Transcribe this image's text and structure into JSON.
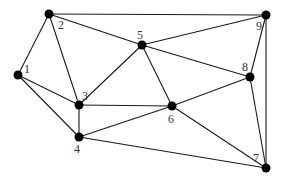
{
  "diagram": {
    "type": "undirected-graph",
    "colors": {
      "edge": "#1a1a1a",
      "node": "#000000",
      "label": "#333333",
      "background": "#ffffff"
    },
    "nodes": [
      {
        "id": "1",
        "label": "1",
        "x": 18,
        "y": 75,
        "label_dx": 6,
        "label_dy": -2
      },
      {
        "id": "2",
        "label": "2",
        "x": 49,
        "y": 14,
        "label_dx": 9,
        "label_dy": 15
      },
      {
        "id": "3",
        "label": "3",
        "x": 79,
        "y": 105,
        "label_dx": 3,
        "label_dy": -5
      },
      {
        "id": "4",
        "label": "4",
        "x": 79,
        "y": 137,
        "label_dx": -5,
        "label_dy": 16
      },
      {
        "id": "5",
        "label": "5",
        "x": 142,
        "y": 45,
        "label_dx": -5,
        "label_dy": -6
      },
      {
        "id": "6",
        "label": "6",
        "x": 172,
        "y": 106,
        "label_dx": -4,
        "label_dy": 17
      },
      {
        "id": "7",
        "label": "7",
        "x": 266,
        "y": 168,
        "label_dx": -13,
        "label_dy": -6
      },
      {
        "id": "8",
        "label": "8",
        "x": 250,
        "y": 77,
        "label_dx": -8,
        "label_dy": -6
      },
      {
        "id": "9",
        "label": "9",
        "x": 266,
        "y": 15,
        "label_dx": -10,
        "label_dy": 15
      }
    ],
    "edges": [
      [
        "1",
        "2"
      ],
      [
        "1",
        "3"
      ],
      [
        "1",
        "4"
      ],
      [
        "2",
        "3"
      ],
      [
        "2",
        "5"
      ],
      [
        "2",
        "9"
      ],
      [
        "3",
        "4"
      ],
      [
        "3",
        "5"
      ],
      [
        "3",
        "6"
      ],
      [
        "4",
        "6"
      ],
      [
        "4",
        "7"
      ],
      [
        "5",
        "6"
      ],
      [
        "5",
        "8"
      ],
      [
        "5",
        "9"
      ],
      [
        "6",
        "7"
      ],
      [
        "6",
        "8"
      ],
      [
        "8",
        "9"
      ],
      [
        "8",
        "7"
      ],
      [
        "9",
        "7"
      ]
    ]
  }
}
